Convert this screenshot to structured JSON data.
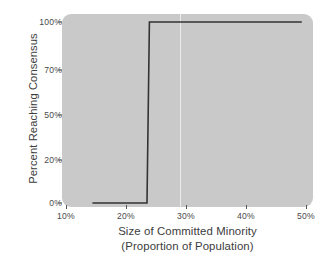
{
  "chart_data": {
    "type": "line",
    "title": "",
    "xlabel": "Size of Committed Minority",
    "xlabel_line2": "(Proportion of Population)",
    "ylabel": "Percent Reaching Consensus",
    "xlim": [
      6.5,
      51.5
    ],
    "ylim": [
      -5,
      105
    ],
    "grid": false,
    "legend": null,
    "xticks": [
      {
        "value": 10,
        "label": "10%"
      },
      {
        "value": 20,
        "label": "20%"
      },
      {
        "value": 30,
        "label": "30%"
      },
      {
        "value": 40,
        "label": "40%"
      },
      {
        "value": 50,
        "label": "50%"
      }
    ],
    "yticks": [
      {
        "value": 0,
        "label": "0%"
      },
      {
        "value": 20,
        "label": "20%"
      },
      {
        "value": 50,
        "label": "50%"
      },
      {
        "value": 70,
        "label": "70%"
      },
      {
        "value": 100,
        "label": "100%"
      }
    ],
    "annotations": [
      {
        "name": "critical-threshold-gridline",
        "type": "vline",
        "x": 29.0,
        "color": "#f2f2f2"
      }
    ],
    "series": [
      {
        "name": "Percent Reaching Consensus",
        "color": "#333333",
        "linewidth": 1.6,
        "x": [
          14.4,
          23.5,
          23.9,
          49.3
        ],
        "values": [
          0,
          0,
          100,
          100
        ],
        "description": "Step function: 0% consensus below ~23.5% committed minority, jumping to 100% at ~24%."
      }
    ],
    "style": {
      "plot_background": "#c9c9c9",
      "figure_background": "#ffffff",
      "tick_color": "#4a4a4a",
      "label_color": "#3c3c3c"
    }
  }
}
